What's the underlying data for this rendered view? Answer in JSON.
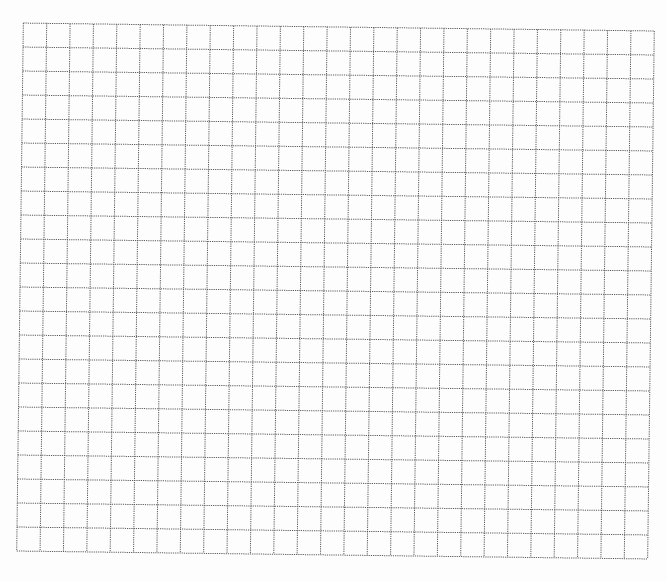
{
  "grid": {
    "columns": 27,
    "rows": 22,
    "cell_width": 23.37,
    "cell_height": 24,
    "line_color": "#5a5a5a",
    "line_style": "dotted",
    "background_color": "#ffffff",
    "rotation_deg": 0.72
  }
}
